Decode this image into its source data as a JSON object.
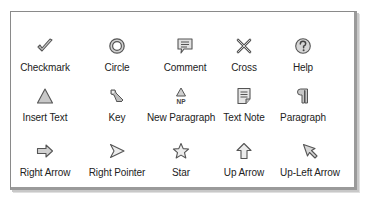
{
  "panel": {
    "title": "Note icon chooser",
    "rows": [
      [
        {
          "label": "Checkmark",
          "icon": "checkmark-icon"
        },
        {
          "label": "Circle",
          "icon": "circle-icon"
        },
        {
          "label": "Comment",
          "icon": "comment-icon"
        },
        {
          "label": "Cross",
          "icon": "cross-icon"
        },
        {
          "label": "Help",
          "icon": "help-icon"
        }
      ],
      [
        {
          "label": "Insert Text",
          "icon": "insert-text-icon"
        },
        {
          "label": "Key",
          "icon": "key-icon"
        },
        {
          "label": "New Paragraph",
          "icon": "new-paragraph-icon"
        },
        {
          "label": "Text Note",
          "icon": "text-note-icon"
        },
        {
          "label": "Paragraph",
          "icon": "paragraph-icon"
        }
      ],
      [
        {
          "label": "Right Arrow",
          "icon": "right-arrow-icon"
        },
        {
          "label": "Right Pointer",
          "icon": "right-pointer-icon"
        },
        {
          "label": "Star",
          "icon": "star-icon"
        },
        {
          "label": "Up Arrow",
          "icon": "up-arrow-icon"
        },
        {
          "label": "Up-Left Arrow",
          "icon": "up-left-arrow-icon"
        }
      ]
    ],
    "icon_colors": {
      "stroke": "#555555",
      "fill": "#c8c8c8"
    }
  }
}
